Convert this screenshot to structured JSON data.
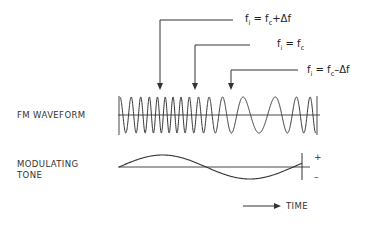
{
  "diagram": {
    "labels": {
      "fm_waveform": "FM WAVEFORM",
      "modulating_line1": "MODULATING",
      "modulating_line2": "TONE",
      "time": "TIME",
      "plus": "+",
      "minus": "–"
    },
    "equations": [
      {
        "lhs": "f",
        "lhs_sub": "i",
        "op": " = ",
        "rhs": "f",
        "rhs_sub": "c",
        "tail": "+Δf"
      },
      {
        "lhs": "f",
        "lhs_sub": "i",
        "op": " = ",
        "rhs": "f",
        "rhs_sub": "c",
        "tail": ""
      },
      {
        "lhs": "f",
        "lhs_sub": "i",
        "op": " = ",
        "rhs": "f",
        "rhs_sub": "c",
        "tail": "–Δf"
      }
    ],
    "colors": {
      "line": "#333333",
      "background": "#ffffff"
    }
  }
}
